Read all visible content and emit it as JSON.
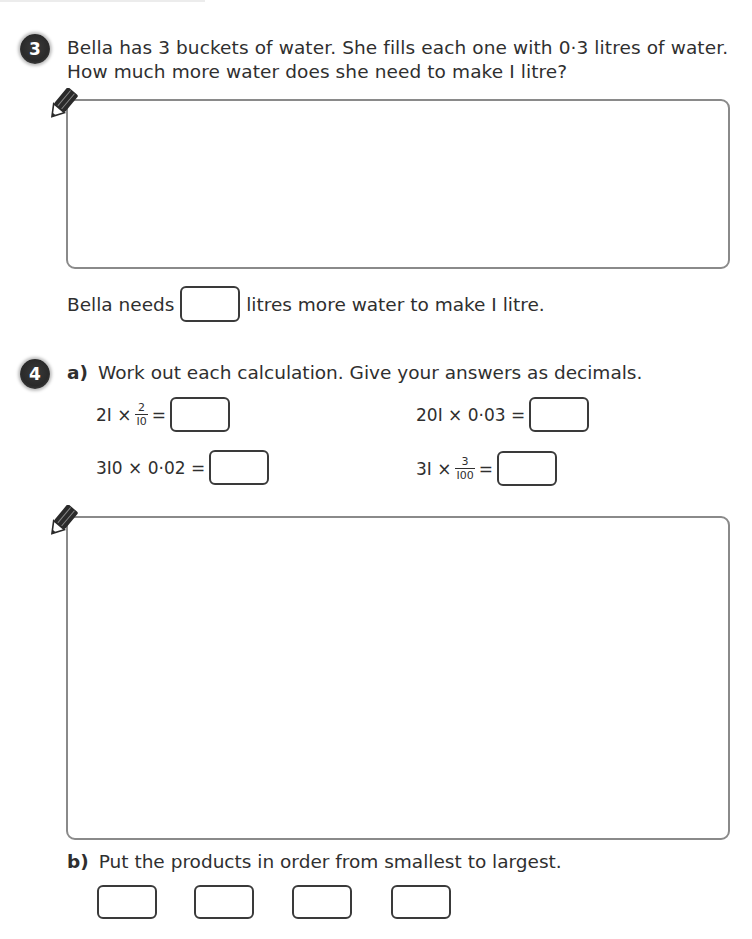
{
  "question3": {
    "number": "3",
    "line1": "Bella has 3 buckets of water. She fills each one with 0·3 litres of water.",
    "line2": "How much more water does she need to make I litre?",
    "answer_prefix": "Bella needs ",
    "answer_suffix": " litres more water to make I litre.",
    "answer_value": ""
  },
  "question4": {
    "number": "4",
    "part_a": {
      "label": "a)",
      "instruction": "Work out each calculation. Give your answers as decimals.",
      "calculations": [
        {
          "lhs": "2I ×",
          "frac_num": "2",
          "frac_den": "I0",
          "rhs": "=",
          "answer": ""
        },
        {
          "lhs": "20I × 0·03 =",
          "answer": ""
        },
        {
          "lhs": "3I0 × 0·02 =",
          "answer": ""
        },
        {
          "lhs": "3I ×",
          "frac_num": "3",
          "frac_den": "I00",
          "rhs": "=",
          "answer": ""
        }
      ]
    },
    "part_b": {
      "label": "b)",
      "instruction": "Put the products in order from smallest to largest.",
      "boxes": [
        "",
        "",
        "",
        ""
      ]
    }
  },
  "icons": {
    "pencil": "pencil-icon"
  },
  "colors": {
    "badge": "#2e2e2e",
    "box_border": "#8a8a8a",
    "answer_border": "#3a3a3a",
    "text": "#2f2f2f"
  }
}
